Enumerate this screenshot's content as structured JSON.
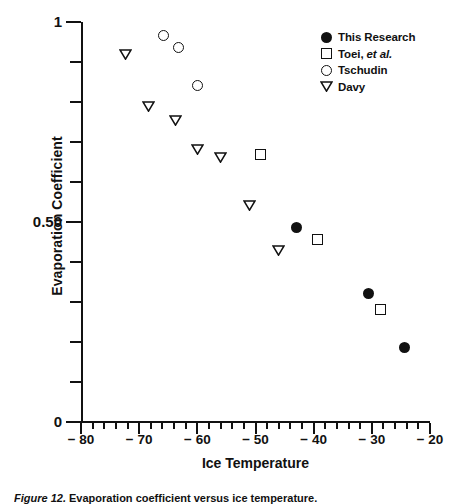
{
  "chart_data": {
    "type": "scatter",
    "title": "",
    "xlabel": "Ice Temperature",
    "ylabel": "Evaporation Coefficient",
    "xlim": [
      -80,
      -20
    ],
    "ylim": [
      0,
      1
    ],
    "xticks": [
      -80,
      -70,
      -60,
      -50,
      -40,
      -30,
      -20
    ],
    "xticklabels": [
      "− 80",
      "− 70",
      "− 60",
      "− 50",
      "− 40",
      "− 30",
      "− 20"
    ],
    "xminor_step": 2,
    "yticks": [
      0,
      0.5,
      1
    ],
    "yticklabels": [
      "0",
      "0.50",
      "1"
    ],
    "yminor_step": 0.1,
    "grid": false,
    "legend_position": "top-right",
    "series": [
      {
        "name": "This Research",
        "marker": "filled-circle",
        "points": [
          {
            "x": -43.0,
            "y": 0.4875
          },
          {
            "x": -30.6,
            "y": 0.3225
          },
          {
            "x": -24.3,
            "y": 0.1875
          }
        ]
      },
      {
        "name": "Toei, et al.",
        "marker": "open-square",
        "points": [
          {
            "x": -49.1,
            "y": 0.67
          },
          {
            "x": -39.4,
            "y": 0.4575
          },
          {
            "x": -28.5,
            "y": 0.2825
          }
        ]
      },
      {
        "name": "Tschudin",
        "marker": "open-circle",
        "points": [
          {
            "x": -65.9,
            "y": 0.9675
          },
          {
            "x": -63.2,
            "y": 0.9375
          },
          {
            "x": -59.9,
            "y": 0.8425
          }
        ]
      },
      {
        "name": "Davy",
        "marker": "open-triangle-down",
        "points": [
          {
            "x": -72.4,
            "y": 0.92
          },
          {
            "x": -68.4,
            "y": 0.79
          },
          {
            "x": -63.7,
            "y": 0.755
          },
          {
            "x": -59.9,
            "y": 0.6825
          },
          {
            "x": -56.0,
            "y": 0.6625
          },
          {
            "x": -51.1,
            "y": 0.5425
          },
          {
            "x": -46.1,
            "y": 0.43
          }
        ]
      }
    ]
  },
  "legend": {
    "entries": [
      {
        "label": "This Research",
        "label_italic": "",
        "marker": "filled-circle"
      },
      {
        "label": "Toei, ",
        "label_italic": "et al.",
        "marker": "open-square"
      },
      {
        "label": "Tschudin",
        "label_italic": "",
        "marker": "open-circle"
      },
      {
        "label": "Davy",
        "label_italic": "",
        "marker": "open-triangle-down"
      }
    ]
  },
  "caption": {
    "prefix": "Figure 12.",
    "text": "  Evaporation coefficient versus ice temperature."
  }
}
